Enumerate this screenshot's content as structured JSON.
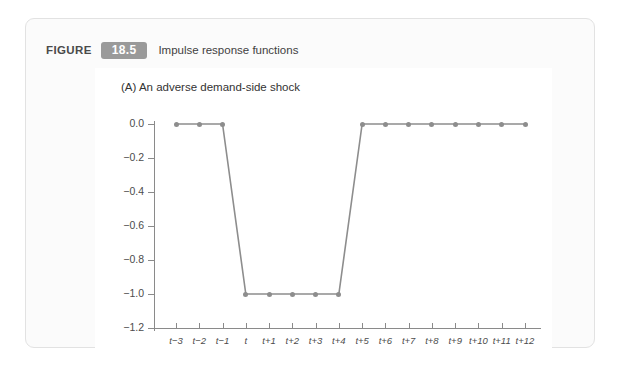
{
  "figure": {
    "label_word": "FIGURE",
    "number": "18.5",
    "caption": "Impulse response functions",
    "badge_color": "#9a9a9a",
    "card_background": "#fbfbfb",
    "panel_background": "#ffffff"
  },
  "chart_data": {
    "type": "line",
    "title": "(A) An adverse demand-side shock",
    "xlabel": "",
    "ylabel": "",
    "categories": [
      "t−3",
      "t−2",
      "t−1",
      "t",
      "t+1",
      "t+2",
      "t+3",
      "t+4",
      "t+5",
      "t+6",
      "t+7",
      "t+8",
      "t+9",
      "t+10",
      "t+11",
      "t+12"
    ],
    "values": [
      0.0,
      0.0,
      0.0,
      -1.0,
      -1.0,
      -1.0,
      -1.0,
      -1.0,
      0.0,
      0.0,
      0.0,
      0.0,
      0.0,
      0.0,
      0.0,
      0.0
    ],
    "ylim": [
      -1.2,
      0.0
    ],
    "yticks": [
      0.0,
      -0.2,
      -0.4,
      -0.6,
      -0.8,
      -1.0,
      -1.2
    ],
    "ytick_labels": [
      "0.0",
      "−0.2",
      "−0.4",
      "−0.6",
      "−0.8",
      "−1.0",
      "−1.2"
    ],
    "grid": false,
    "legend": null,
    "line_color": "#8d8d8d",
    "marker_color": "#8d8d8d",
    "marker_shape": "circle",
    "axis_color": "#8a8a8a"
  }
}
